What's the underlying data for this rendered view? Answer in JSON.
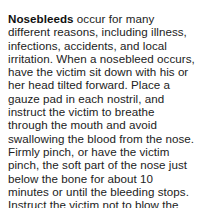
{
  "document": {
    "term": "Nosebleeds",
    "lines": [
      " occur for many",
      "different reasons, including illness,",
      "infections, accidents, and local",
      "irritation. When a nosebleed occurs,",
      "have the victim sit down with his or",
      "her head tilted forward. Place a",
      "gauze pad in each nostril, and",
      "instruct the victim to breathe",
      "through the mouth and avoid",
      "swallowing the blood from the nose.",
      "Firmly pinch, or have the victim",
      "pinch, the soft part of the nose just",
      "below the bone for about 10",
      "minutes or until the bleeding stops.",
      "Instruct the victim not to blow the"
    ]
  }
}
